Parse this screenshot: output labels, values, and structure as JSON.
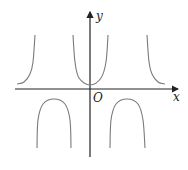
{
  "chart_data": {
    "type": "line",
    "title": "",
    "xlabel": "x",
    "ylabel": "y",
    "origin_label": "O",
    "grid": false,
    "legend": null,
    "series": [
      {
        "name": "branch-upper-left",
        "points": [
          [
            17,
            84
          ],
          [
            24,
            82
          ],
          [
            30,
            74
          ],
          [
            33,
            62
          ],
          [
            35,
            35
          ]
        ]
      },
      {
        "name": "branch-lower-left",
        "points": [
          [
            37,
            148
          ],
          [
            38,
            120
          ],
          [
            43,
            104
          ],
          [
            54,
            99
          ],
          [
            65,
            104
          ],
          [
            70,
            120
          ],
          [
            71,
            148
          ]
        ]
      },
      {
        "name": "branch-upper-center",
        "points": [
          [
            73,
            35
          ],
          [
            75,
            62
          ],
          [
            79,
            78
          ],
          [
            90,
            85
          ],
          [
            101,
            78
          ],
          [
            106,
            62
          ],
          [
            108,
            35
          ]
        ]
      },
      {
        "name": "branch-lower-right",
        "points": [
          [
            110,
            148
          ],
          [
            111,
            120
          ],
          [
            116,
            104
          ],
          [
            127,
            99
          ],
          [
            138,
            104
          ],
          [
            143,
            120
          ],
          [
            145,
            148
          ]
        ]
      },
      {
        "name": "branch-upper-right",
        "points": [
          [
            147,
            35
          ],
          [
            149,
            62
          ],
          [
            152,
            74
          ],
          [
            158,
            82
          ],
          [
            165,
            84
          ]
        ]
      }
    ],
    "axes": {
      "x_axis": {
        "y": 89,
        "from": 15,
        "to": 178
      },
      "y_axis": {
        "x": 90,
        "from": 157,
        "to": 12
      }
    }
  },
  "labels": {
    "x": "x",
    "y": "y",
    "origin": "O"
  },
  "colors": {
    "axis": "#222222",
    "curve": "#7a7a7a"
  }
}
